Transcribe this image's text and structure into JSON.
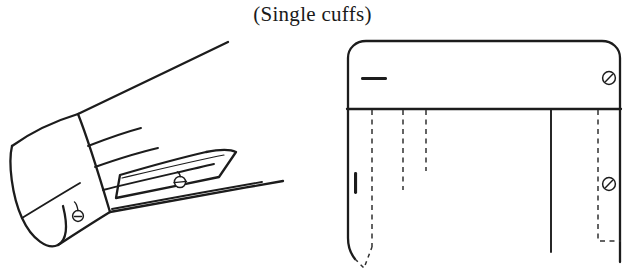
{
  "figure": {
    "title": "(Single cuffs)",
    "background_color": "#ffffff",
    "ink_color": "#1c1c1c",
    "dash_color": "#303030",
    "type": "technical-garment-illustration"
  },
  "panels": {
    "left": {
      "name": "perspective-sleeve-view",
      "description": "three-quarter perspective drawing of a shirt sleeve ending in a single cuff",
      "parts": [
        {
          "name": "cuff-band",
          "label": "cuff"
        },
        {
          "name": "cuff-opening-ellipse",
          "label": "cuff opening"
        },
        {
          "name": "sleeve-body",
          "label": "sleeve"
        },
        {
          "name": "sleeve-placket",
          "label": "placket"
        },
        {
          "name": "gather-pleat-lines",
          "label": "gathers",
          "count": 4
        }
      ],
      "markings": [
        {
          "name": "cuff-button-mark",
          "symbol": "button",
          "glyph": "circle-with-stem"
        },
        {
          "name": "placket-buttonhole-mark",
          "symbol": "buttonhole",
          "glyph": "circle-with-bar"
        }
      ]
    },
    "right": {
      "name": "flat-pattern-view",
      "description": "flat laid-out view of the cuff band and sleeve with fold and pleat lines",
      "parts": [
        {
          "name": "cuff-band-flat",
          "label": "cuff band"
        },
        {
          "name": "sleeve-panel-flat",
          "label": "sleeve panel"
        },
        {
          "name": "cuff-seam-line",
          "label": "cuff seam"
        },
        {
          "name": "placket-seam-line",
          "label": "placket seam"
        }
      ],
      "markings": [
        {
          "name": "cuff-buttonhole-mark",
          "symbol": "buttonhole",
          "glyph": "horizontal-bar"
        },
        {
          "name": "cuff-button-mark",
          "symbol": "button",
          "glyph": "circle-with-slash"
        },
        {
          "name": "sleeve-buttonhole-mark",
          "symbol": "buttonhole",
          "glyph": "vertical-bar"
        },
        {
          "name": "sleeve-button-mark",
          "symbol": "button",
          "glyph": "circle-with-slash"
        }
      ],
      "fold_lines": [
        {
          "name": "pleat-fold-line-1",
          "style": "dashed"
        },
        {
          "name": "pleat-fold-line-2",
          "style": "dashed"
        },
        {
          "name": "pleat-fold-line-3",
          "style": "dashed"
        },
        {
          "name": "placket-fold-line",
          "style": "dashed"
        },
        {
          "name": "pleat-fold-v",
          "style": "dashed"
        }
      ]
    }
  }
}
